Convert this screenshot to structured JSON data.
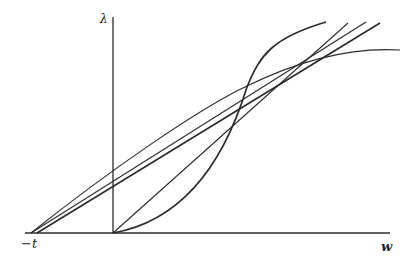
{
  "diagram": {
    "type": "line-diagram",
    "axes": {
      "y_label": "λ",
      "x_label": "w",
      "x_origin_offset_label": "−t"
    },
    "curves": [
      {
        "name": "line-from-minus-t-upper",
        "kind": "straight",
        "description": "Straight line starting at −t, passing through intersection point"
      },
      {
        "name": "line-from-minus-t-lower",
        "kind": "straight",
        "description": "Second straight line starting near −t, passing through intersection point"
      },
      {
        "name": "line-from-origin",
        "kind": "straight",
        "description": "Straight line from origin through intersection point"
      },
      {
        "name": "convex-curve",
        "kind": "convex",
        "description": "Convex curve from origin, steepest after intersection"
      },
      {
        "name": "concave-curve",
        "kind": "concave",
        "description": "Concave curve flattening to the right"
      }
    ],
    "colors": {
      "line": "#2a2a2a",
      "background": "#ffffff"
    }
  }
}
